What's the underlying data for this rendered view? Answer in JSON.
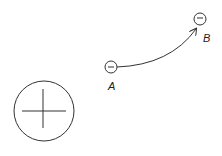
{
  "diagram": {
    "source_charge": {
      "sign": "+",
      "symbol": "plus-icon"
    },
    "test_charges": [
      {
        "label": "A",
        "sign": "-",
        "symbol": "minus-icon"
      },
      {
        "label": "B",
        "sign": "-",
        "symbol": "minus-icon"
      }
    ],
    "path": {
      "from": "A",
      "to": "B",
      "arrow": "arrow-to-B"
    },
    "colors": {
      "stroke": "#333333",
      "background": "#ffffff"
    }
  }
}
